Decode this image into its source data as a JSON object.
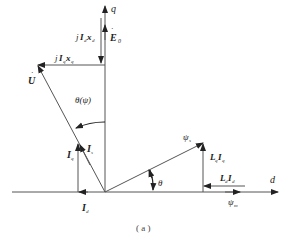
{
  "figure": {
    "caption": "( a )",
    "axes": {
      "q_label": "q",
      "d_label": "d"
    },
    "vectors": {
      "E0": {
        "label": "E",
        "sub": "0"
      },
      "jIdxd": {
        "prefix": "j",
        "I": "I",
        "Isub": "d",
        "x": "x",
        "xsub": "d"
      },
      "jIqxq": {
        "prefix": "j",
        "I": "I",
        "Isub": "q",
        "x": "x",
        "xsub": "q"
      },
      "U": {
        "label": "U"
      },
      "Is": {
        "label": "I",
        "sub": "s"
      },
      "Iq": {
        "label": "I",
        "sub": "q"
      },
      "Id": {
        "label": "I",
        "sub": "d"
      },
      "psi_s": {
        "label": "ψ",
        "sub": "s"
      },
      "psi_m": {
        "label": "ψ",
        "sub": "m"
      },
      "LqIq": {
        "L": "L",
        "Lsub": "q",
        "I": "I",
        "Isub": "q"
      },
      "LdId": {
        "L": "L",
        "Lsub": "d",
        "I": "I",
        "Isub": "d"
      }
    },
    "angles": {
      "theta_psi": "θ(ψ)",
      "theta": "θ"
    },
    "colors": {
      "line": "#555555",
      "text": "#222222"
    }
  }
}
